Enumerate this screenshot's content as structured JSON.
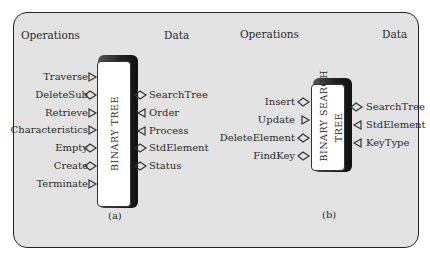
{
  "diagrams": [
    {
      "id": "a",
      "caption": "(a)",
      "box_label": "BINARY TREE",
      "headers": {
        "left": "Operations",
        "right": "Data"
      },
      "operations": [
        {
          "label": "Traverse",
          "connector": "triangle"
        },
        {
          "label": "DeleteSub",
          "connector": "diamond"
        },
        {
          "label": "Retrieve",
          "connector": "triangle"
        },
        {
          "label": "Characteristics",
          "connector": "triangle"
        },
        {
          "label": "Empty",
          "connector": "diamond"
        },
        {
          "label": "Create",
          "connector": "diamond"
        },
        {
          "label": "Terminate",
          "connector": "triangle"
        }
      ],
      "data": [
        {
          "label": "SearchTree",
          "connector": "diamond"
        },
        {
          "label": "Order",
          "connector": "triangle-left"
        },
        {
          "label": "Process",
          "connector": "triangle-left"
        },
        {
          "label": "StdElement",
          "connector": "diamond"
        },
        {
          "label": "Status",
          "connector": "diamond"
        }
      ]
    },
    {
      "id": "b",
      "caption": "(b)",
      "box_label_line1": "BINARY  SEARCH",
      "box_label_line2": "TREE",
      "headers": {
        "left": "Operations",
        "right": "Data"
      },
      "operations": [
        {
          "label": "Insert",
          "connector": "diamond"
        },
        {
          "label": "Update",
          "connector": "triangle"
        },
        {
          "label": "DeleteElement",
          "connector": "diamond"
        },
        {
          "label": "FindKey",
          "connector": "diamond"
        }
      ],
      "data": [
        {
          "label": "SearchTree",
          "connector": "diamond"
        },
        {
          "label": "StdElement",
          "connector": "triangle-left"
        },
        {
          "label": "KeyType",
          "connector": "triangle-left"
        }
      ]
    }
  ]
}
